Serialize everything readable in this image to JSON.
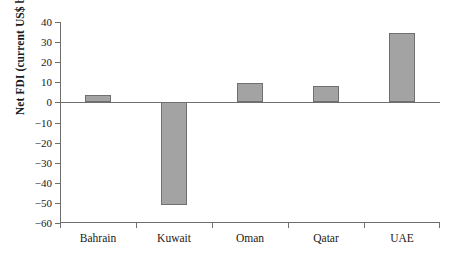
{
  "chart_data": {
    "type": "bar",
    "title": "",
    "subtitle": "",
    "xlabel": "",
    "ylabel": "Net FDI (current US$ billions)",
    "categories": [
      "Bahrain",
      "Kuwait",
      "Oman",
      "Qatar",
      "UAE"
    ],
    "values": [
      3.5,
      -51,
      9.5,
      8,
      34.5
    ],
    "series": [
      {
        "name": "Net FDI",
        "values": [
          3.5,
          -51,
          9.5,
          8,
          34.5
        ]
      }
    ],
    "ylim": [
      -60,
      40
    ],
    "ytick_labels": [
      "40",
      "30",
      "20",
      "10",
      "0",
      "−10",
      "−20",
      "−30",
      "−40",
      "−50",
      "−60"
    ],
    "ytick_values": [
      40,
      30,
      20,
      10,
      0,
      -10,
      -20,
      -30,
      -40,
      -50,
      -60
    ],
    "grid": false,
    "legend": "none",
    "bar_color": "#a3a3a3",
    "bar_edge_color": "#707070",
    "axis_color": "#6e6e6e",
    "background": "#ffffff"
  },
  "axes": {
    "y_title": "Net FDI (current US$ billions)"
  }
}
